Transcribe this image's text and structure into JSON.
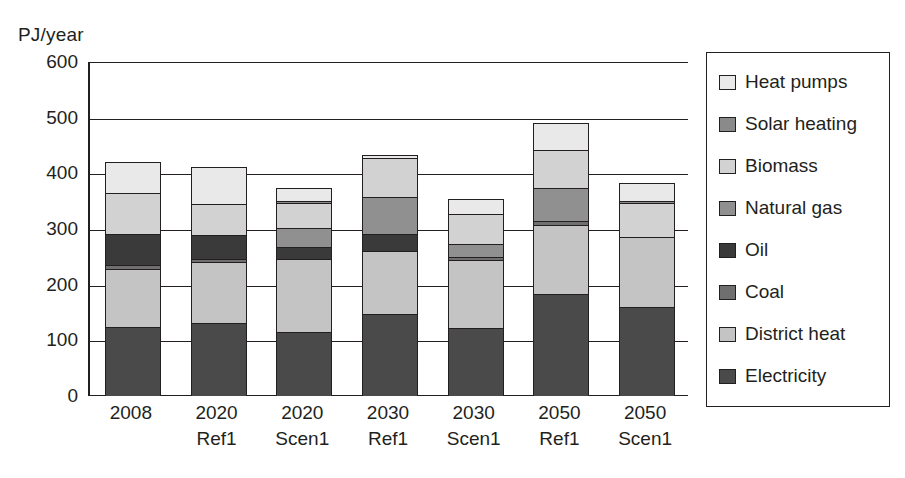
{
  "chart_data": {
    "type": "bar",
    "stacked": true,
    "title": "",
    "subtitle": "",
    "xlabel": "",
    "ylabel": "PJ/year",
    "ylim": [
      0,
      600
    ],
    "yticks": [
      0,
      100,
      200,
      300,
      400,
      500,
      600
    ],
    "ytick_labels": [
      "0",
      "100",
      "200",
      "300",
      "400",
      "500",
      "600"
    ],
    "grid": true,
    "grid_axis": "y",
    "legend_position": "right",
    "categories": [
      "2008",
      "2020 Ref1",
      "2020 Scen1",
      "2030 Ref1",
      "2030 Scen1",
      "2050 Ref1",
      "2050 Scen1"
    ],
    "category_lines": [
      {
        "line1": "2008",
        "line2": ""
      },
      {
        "line1": "2020",
        "line2": "Ref1"
      },
      {
        "line1": "2020",
        "line2": "Scen1"
      },
      {
        "line1": "2030",
        "line2": "Ref1"
      },
      {
        "line1": "2030",
        "line2": "Scen1"
      },
      {
        "line1": "2050",
        "line2": "Ref1"
      },
      {
        "line1": "2050",
        "line2": "Scen1"
      }
    ],
    "series": [
      {
        "name": "Electricity",
        "color": "#4a4a4a",
        "values": [
          123,
          130,
          114,
          145,
          120,
          181,
          158
        ]
      },
      {
        "name": "District heat",
        "color": "#c4c4c4",
        "values": [
          104,
          109,
          130,
          113,
          122,
          124,
          125
        ]
      },
      {
        "name": "Coal",
        "color": "#6f6f6f",
        "values": [
          6,
          5,
          0,
          0,
          6,
          7,
          0
        ]
      },
      {
        "name": "Oil",
        "color": "#3a3a3a",
        "values": [
          57,
          44,
          21,
          32,
          0,
          0,
          0
        ]
      },
      {
        "name": "Natural gas",
        "color": "#909090",
        "values": [
          0,
          0,
          35,
          65,
          24,
          60,
          0
        ]
      },
      {
        "name": "Biomass",
        "color": "#d2d2d2",
        "values": [
          72,
          55,
          45,
          70,
          53,
          68,
          62
        ]
      },
      {
        "name": "Solar heating",
        "color": "#8a8a8a",
        "values": [
          0,
          0,
          4,
          0,
          0,
          0,
          4
        ]
      },
      {
        "name": "Heat pumps",
        "color": "#e9e9e9",
        "values": [
          57,
          67,
          23,
          7,
          28,
          48,
          32
        ]
      }
    ],
    "totals": [
      419,
      410,
      372,
      432,
      353,
      488,
      381
    ]
  },
  "legend": {
    "items": [
      {
        "label": "Heat pumps",
        "color": "#e9e9e9"
      },
      {
        "label": "Solar heating",
        "color": "#8a8a8a"
      },
      {
        "label": "Biomass",
        "color": "#d2d2d2"
      },
      {
        "label": "Natural gas",
        "color": "#909090"
      },
      {
        "label": "Oil",
        "color": "#3a3a3a"
      },
      {
        "label": "Coal",
        "color": "#6f6f6f"
      },
      {
        "label": "District heat",
        "color": "#c4c4c4"
      },
      {
        "label": "Electricity",
        "color": "#4a4a4a"
      }
    ]
  },
  "colors": {
    "axis": "#231f20",
    "background": "#ffffff",
    "text": "#231f20"
  }
}
